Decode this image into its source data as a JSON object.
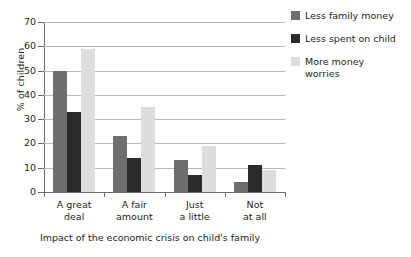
{
  "chart_data": {
    "type": "bar",
    "title": "",
    "xlabel": "Impact of the economic crisis on child's family",
    "ylabel": "% of children",
    "ylim": [
      0,
      70
    ],
    "yticks": [
      0,
      10,
      20,
      30,
      40,
      50,
      60,
      70
    ],
    "grid": "horizontal",
    "legend_position": "right",
    "categories": [
      "A great\ndeal",
      "A fair\namount",
      "Just\na little",
      "Not\nat all"
    ],
    "series": [
      {
        "name": "Less family money",
        "color": "#6e6e6e",
        "values": [
          50,
          23,
          13,
          4
        ]
      },
      {
        "name": "Less spent on child",
        "color": "#2b2b2b",
        "values": [
          33,
          14,
          7,
          11
        ]
      },
      {
        "name": "More money\nworries",
        "color": "#dddddd",
        "values": [
          59,
          35,
          19,
          9
        ]
      }
    ]
  }
}
